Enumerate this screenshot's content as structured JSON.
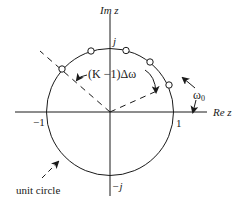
{
  "diagram": {
    "axes": {
      "x_label": "Re z",
      "y_label": "Im z",
      "x_ticks": {
        "neg_one": "−1",
        "pos_one": "1"
      },
      "y_ticks": {
        "pos_j": "j",
        "neg_j": "−j"
      }
    },
    "annotations": {
      "angle_span": "(K −1)Δω",
      "start_angle": "ω",
      "start_angle_sub": "0",
      "unit_circle_label": "unit circle"
    },
    "sample_points": [
      {
        "id": 1,
        "cx": 169,
        "cy": 85
      },
      {
        "id": 2,
        "cx": 150,
        "cy": 62
      },
      {
        "id": 3,
        "cx": 126,
        "cy": 51
      },
      {
        "id": 4,
        "cx": 91,
        "cy": 51
      },
      {
        "id": 5,
        "cx": 62,
        "cy": 69
      }
    ],
    "colors": {
      "stroke": "#1a1a1a",
      "background": "#ffffff"
    }
  }
}
